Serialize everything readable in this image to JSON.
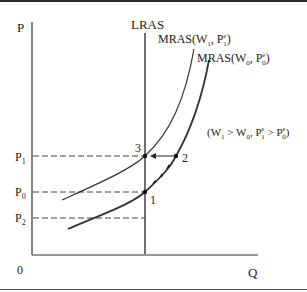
{
  "diagram": {
    "axes": {
      "y_label": "P",
      "x_label": "Q",
      "origin_label": "0"
    },
    "price_levels": [
      {
        "id": "p1",
        "main": "P",
        "sub": "1"
      },
      {
        "id": "p0",
        "main": "P",
        "sub": "0"
      },
      {
        "id": "p2",
        "main": "P",
        "sub": "2"
      }
    ],
    "curves": {
      "lras": "LRAS",
      "mras1": {
        "prefix": "MRAS(W",
        "w_sub": "1",
        "mid": ", P",
        "e": "e",
        "p_sub": "1",
        "suffix": ")"
      },
      "mras0": {
        "prefix": "MRAS(W",
        "w_sub": "0",
        "mid": ", P",
        "e": "e",
        "p_sub": "0",
        "suffix": ")"
      }
    },
    "points": [
      "1",
      "2",
      "3"
    ],
    "condition": {
      "open": "(W",
      "w1_sub": "1",
      "gt1": " > W",
      "w0_sub": "0",
      "comma": ", P",
      "e1": "e",
      "p1_sub": "1",
      "gt2": " > P",
      "e0": "e",
      "p0_sub": "0",
      "close": ")"
    },
    "colors": {
      "ink": "#222222",
      "dash": "#444444"
    }
  }
}
